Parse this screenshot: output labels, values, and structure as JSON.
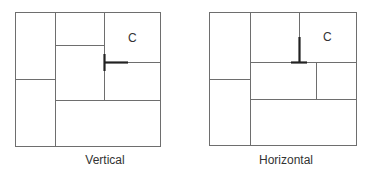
{
  "diagrams": [
    {
      "caption": "Vertical",
      "cell_label": "C"
    },
    {
      "caption": "Horizontal",
      "cell_label": "C"
    }
  ],
  "colors": {
    "line": "#6e6e6e",
    "emphasis": "#222222",
    "text": "#333333"
  }
}
